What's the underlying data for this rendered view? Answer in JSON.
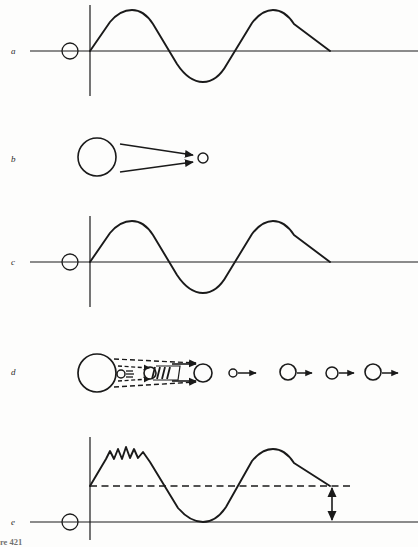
{
  "figure": {
    "caption_clipped": "re 421",
    "background_color": "#fdfdfc",
    "ink_color": "#1a1a1a",
    "width": 418,
    "height": 547,
    "panel_labels": [
      {
        "id": "a",
        "text": "a",
        "x": 11,
        "y": 47
      },
      {
        "id": "b",
        "text": "b",
        "x": 11,
        "y": 155
      },
      {
        "id": "c",
        "text": "c",
        "x": 11,
        "y": 258
      },
      {
        "id": "d",
        "text": "d",
        "x": 11,
        "y": 368
      },
      {
        "id": "e",
        "text": "e",
        "x": 11,
        "y": 518
      }
    ],
    "panels": [
      {
        "id": "a",
        "kind": "waveform",
        "description": "Undistorted sine-like carrier wave on a horizontal axis with a vertical axis and a small open circle source on the axis at left.",
        "axis_y": 51,
        "axis_x_start": 30,
        "axis_x_end": 418,
        "vertical_axis_x": 90,
        "vertical_axis_top": 5,
        "vertical_axis_bottom": 96,
        "source_circle": {
          "cx": 70,
          "cy": 51,
          "r": 8
        },
        "wave_amplitude": 40,
        "wave_start_x": 90,
        "wave_end_x": 330
      },
      {
        "id": "b",
        "kind": "beam-converging",
        "description": "Large open circle at left emitting two straight converging arrows toward a small open circle at right.",
        "large_circle": {
          "cx": 97,
          "cy": 157,
          "r": 19
        },
        "small_circle": {
          "cx": 203,
          "cy": 158,
          "r": 5
        },
        "arrows": 2
      },
      {
        "id": "c",
        "kind": "waveform",
        "description": "Second waveform identical in shape to panel a, representing the wave after passage.",
        "axis_y": 262,
        "axis_x_start": 30,
        "axis_x_end": 418,
        "vertical_axis_x": 90,
        "vertical_axis_top": 216,
        "vertical_axis_bottom": 307,
        "source_circle": {
          "cx": 70,
          "cy": 262,
          "r": 8
        },
        "wave_amplitude": 40,
        "wave_start_x": 90,
        "wave_end_x": 330
      },
      {
        "id": "d",
        "kind": "particle-sequence",
        "description": "Large circle at left with dashed converging arrows onto a cluster of small hatched particles, then a row of separate circles each with a short solid arrow to the right.",
        "large_circle": {
          "cx": 97,
          "cy": 373,
          "r": 19
        },
        "dashed_arrows": 4,
        "cluster": [
          {
            "cx": 122,
            "cy": 374,
            "r": 4,
            "hatched": true
          },
          {
            "cx": 155,
            "cy": 373,
            "r": 6,
            "hatched": true
          }
        ],
        "target_circle": {
          "cx": 203,
          "cy": 373,
          "r": 9
        },
        "sequence": [
          {
            "cx": 233,
            "cy": 373,
            "r": 4,
            "arrow_to_x": 256
          },
          {
            "cx": 288,
            "cy": 372,
            "r": 8,
            "arrow_to_x": 312
          },
          {
            "cx": 332,
            "cy": 373,
            "r": 6,
            "arrow_to_x": 354
          },
          {
            "cx": 373,
            "cy": 372,
            "r": 8,
            "arrow_to_x": 398
          }
        ]
      },
      {
        "id": "e",
        "kind": "waveform-offset",
        "description": "Waveform riding on a raised dashed baseline; its first crest carries three small ripples. A vertical double-headed arrow at right measures the offset between the dashed baseline and the zero axis.",
        "axis_y": 522,
        "axis_x_start": 30,
        "axis_x_end": 418,
        "vertical_axis_x": 90,
        "vertical_axis_top": 437,
        "vertical_axis_bottom": 540,
        "source_circle": {
          "cx": 70,
          "cy": 522,
          "r": 8
        },
        "dashed_baseline_y": 486,
        "dashed_baseline_x_start": 90,
        "dashed_baseline_x_end": 352,
        "ripple_count": 3,
        "offset_arrow": {
          "x": 332,
          "y_top": 487,
          "y_bottom": 521,
          "double_headed": true
        }
      }
    ]
  }
}
